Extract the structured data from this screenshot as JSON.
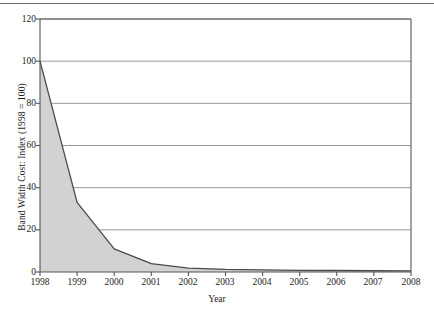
{
  "chart_data": {
    "type": "area",
    "title": "",
    "xlabel": "Year",
    "ylabel": "Band Width Cost: Index (1998 = 100)",
    "x": [
      1998,
      1999,
      2000,
      2001,
      2002,
      2003,
      2004,
      2005,
      2006,
      2007,
      2008
    ],
    "values": [
      100,
      33,
      11,
      4,
      1.8,
      1.2,
      1.0,
      0.8,
      0.7,
      0.6,
      0.5
    ],
    "series": [
      {
        "name": "Band Width Cost Index",
        "values": [
          100,
          33,
          11,
          4,
          1.8,
          1.2,
          1.0,
          0.8,
          0.7,
          0.6,
          0.5
        ]
      }
    ],
    "xlim": [
      1998,
      2008
    ],
    "ylim": [
      0,
      120
    ],
    "ytick_labels": [
      "0",
      "20",
      "40",
      "60",
      "80",
      "100",
      "120"
    ],
    "ytick_values": [
      0,
      20,
      40,
      60,
      80,
      100,
      120
    ],
    "xtick_labels": [
      "1998",
      "1999",
      "2000",
      "2001",
      "2002",
      "2003",
      "2004",
      "2005",
      "2006",
      "2007",
      "2008"
    ],
    "grid": "horizontal",
    "legend": "none",
    "fill_color": "#d2d2d2",
    "line_color": "#4a4a4a",
    "axis_color": "#555555",
    "grid_color": "#8f8f8f",
    "background_color": "#ffffff"
  }
}
